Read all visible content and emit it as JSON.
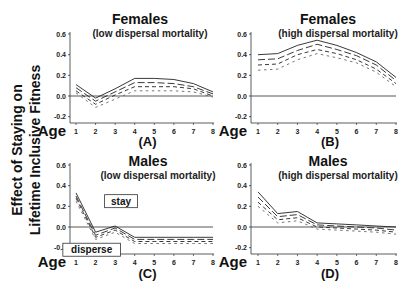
{
  "figure": {
    "y_axis_label_line1": "Effect of Staying on",
    "y_axis_label_line2": "Lifetime Inclusive Fitness",
    "age_label": "Age",
    "annotations": {
      "stay": "stay",
      "disperse": "disperse"
    }
  },
  "chart_data": [
    {
      "type": "line",
      "panel": "(A)",
      "title": "Females",
      "subtitle": "(low dispersal mortality)",
      "xlabel": "Age",
      "ylabel": "Effect of Staying on Lifetime Inclusive Fitness",
      "x": [
        1,
        2,
        3,
        4,
        5,
        6,
        7,
        8
      ],
      "ylim": [
        -0.3,
        0.6
      ],
      "yticks": [
        0.6,
        0.4,
        0.2,
        0.0,
        -0.2
      ],
      "ytick_labels": [
        "0.6",
        "0.4",
        "0.2",
        "0.0",
        "-0.2"
      ],
      "grid": false,
      "reference_line": 0.0,
      "series": [
        {
          "name": "line 1 (solid)",
          "style": "solid",
          "values": [
            0.11,
            -0.02,
            0.07,
            0.17,
            0.17,
            0.16,
            0.12,
            0.04
          ]
        },
        {
          "name": "line 2 (long dash)",
          "style": "long-dash",
          "values": [
            0.08,
            -0.05,
            0.04,
            0.13,
            0.13,
            0.12,
            0.09,
            0.02
          ]
        },
        {
          "name": "line 3 (dash)",
          "style": "dash",
          "values": [
            0.05,
            -0.08,
            0.01,
            0.09,
            0.09,
            0.09,
            0.07,
            0.0
          ]
        },
        {
          "name": "line 4 (short dash)",
          "style": "short-dash",
          "values": [
            0.03,
            -0.11,
            -0.03,
            0.05,
            0.05,
            0.05,
            0.04,
            -0.01
          ]
        }
      ]
    },
    {
      "type": "line",
      "panel": "(B)",
      "title": "Females",
      "subtitle": "(high dispersal mortality)",
      "xlabel": "Age",
      "x": [
        1,
        2,
        3,
        4,
        5,
        6,
        7,
        8
      ],
      "ylim": [
        -0.3,
        0.6
      ],
      "yticks": [
        0.6,
        0.4,
        0.2,
        0.0,
        -0.2
      ],
      "ytick_labels": [
        "0.6",
        "0.4",
        "0.2",
        "0.0",
        "-0.2"
      ],
      "grid": false,
      "reference_line": 0.0,
      "series": [
        {
          "name": "line 1 (solid)",
          "style": "solid",
          "values": [
            0.4,
            0.41,
            0.49,
            0.54,
            0.49,
            0.42,
            0.33,
            0.18
          ]
        },
        {
          "name": "line 2 (long dash)",
          "style": "long-dash",
          "values": [
            0.35,
            0.36,
            0.44,
            0.5,
            0.45,
            0.39,
            0.3,
            0.15
          ]
        },
        {
          "name": "line 3 (dash)",
          "style": "dash",
          "values": [
            0.3,
            0.31,
            0.4,
            0.45,
            0.41,
            0.35,
            0.26,
            0.12
          ]
        },
        {
          "name": "line 4 (short dash)",
          "style": "short-dash",
          "values": [
            0.25,
            0.26,
            0.35,
            0.41,
            0.37,
            0.32,
            0.23,
            0.09
          ]
        }
      ]
    },
    {
      "type": "line",
      "panel": "(C)",
      "title": "Males",
      "subtitle": "(low dispersal mortality)",
      "xlabel": "Age",
      "x": [
        1,
        2,
        3,
        4,
        5,
        6,
        7,
        8
      ],
      "ylim": [
        -0.3,
        0.6
      ],
      "yticks": [
        0.6,
        0.4,
        0.2,
        0.0,
        -0.2
      ],
      "ytick_labels": [
        "0.6",
        "0.4",
        "0.2",
        "0.0",
        "-0.2"
      ],
      "grid": false,
      "reference_line": 0.0,
      "annotations": [
        {
          "text": "stay",
          "x": 3.3,
          "y": 0.25
        },
        {
          "text": "disperse",
          "x": 1.8,
          "y": -0.22
        }
      ],
      "series": [
        {
          "name": "line 1 (solid)",
          "style": "solid",
          "values": [
            0.33,
            -0.05,
            0.01,
            -0.1,
            -0.1,
            -0.1,
            -0.1,
            -0.1
          ]
        },
        {
          "name": "line 2 (long dash)",
          "style": "long-dash",
          "values": [
            0.3,
            -0.08,
            -0.01,
            -0.12,
            -0.12,
            -0.12,
            -0.12,
            -0.12
          ]
        },
        {
          "name": "line 3 (dash)",
          "style": "dash",
          "values": [
            0.28,
            -0.1,
            -0.03,
            -0.14,
            -0.14,
            -0.14,
            -0.14,
            -0.14
          ]
        },
        {
          "name": "line 4 (short dash)",
          "style": "short-dash",
          "values": [
            0.25,
            -0.12,
            -0.05,
            -0.16,
            -0.16,
            -0.16,
            -0.16,
            -0.16
          ]
        }
      ]
    },
    {
      "type": "line",
      "panel": "(D)",
      "title": "Males",
      "subtitle": "(high dispersal mortality)",
      "xlabel": "Age",
      "x": [
        1,
        2,
        3,
        4,
        5,
        6,
        7,
        8
      ],
      "ylim": [
        -0.3,
        0.6
      ],
      "yticks": [
        0.6,
        0.4,
        0.2,
        0.0,
        -0.2
      ],
      "ytick_labels": [
        "0.6",
        "0.4",
        "0.2",
        "0.0",
        "-0.2"
      ],
      "grid": false,
      "reference_line": 0.0,
      "series": [
        {
          "name": "line 1 (solid)",
          "style": "solid",
          "values": [
            0.34,
            0.13,
            0.15,
            0.04,
            0.03,
            0.02,
            0.01,
            0.0
          ]
        },
        {
          "name": "line 2 (long dash)",
          "style": "long-dash",
          "values": [
            0.29,
            0.1,
            0.12,
            0.02,
            0.01,
            0.0,
            -0.01,
            -0.03
          ]
        },
        {
          "name": "line 3 (dash)",
          "style": "dash",
          "values": [
            0.24,
            0.07,
            0.09,
            0.0,
            -0.01,
            -0.02,
            -0.03,
            -0.05
          ]
        },
        {
          "name": "line 4 (short dash)",
          "style": "short-dash",
          "values": [
            0.2,
            0.04,
            0.06,
            -0.02,
            -0.03,
            -0.04,
            -0.05,
            -0.07
          ]
        }
      ]
    }
  ]
}
